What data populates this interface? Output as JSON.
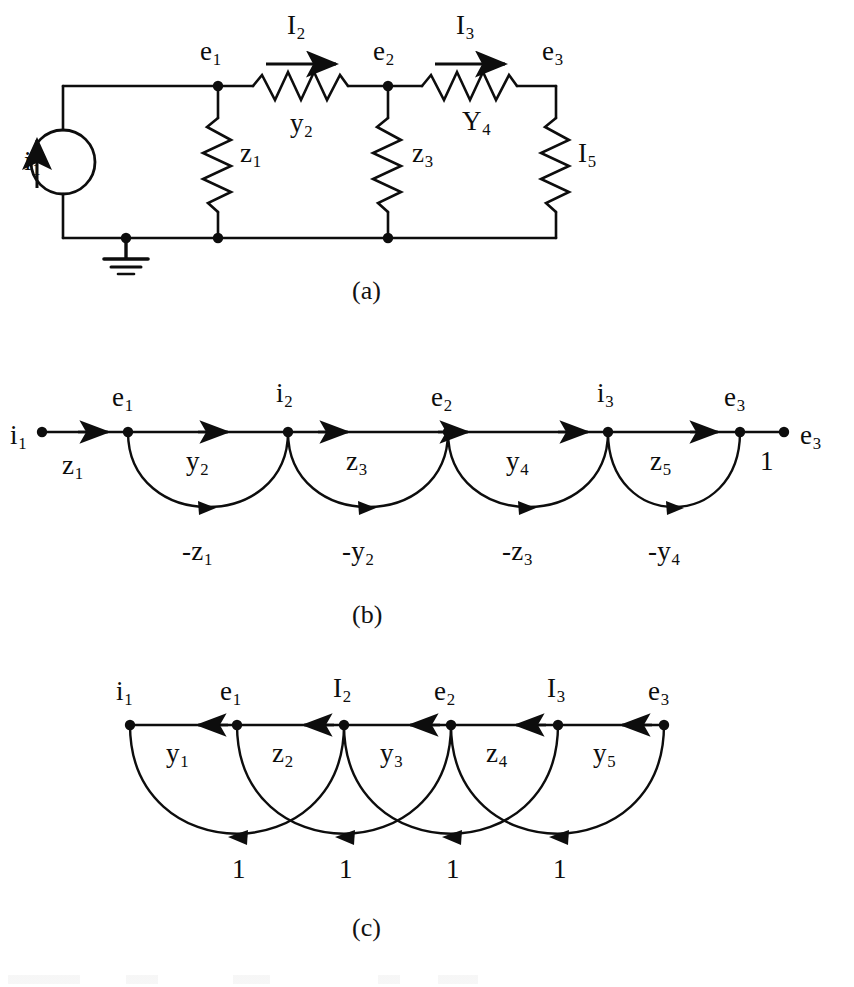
{
  "figure": {
    "captions": [
      "(a)",
      "(b)",
      "(c)"
    ]
  },
  "panel_a": {
    "caption": "(a)",
    "source_label": "i",
    "source_sub": "1",
    "source_icon": "current-source-icon",
    "ground_icon": "ground-icon",
    "node_labels": [
      {
        "base": "e",
        "sub": "1"
      },
      {
        "base": "e",
        "sub": "2"
      },
      {
        "base": "e",
        "sub": "3"
      }
    ],
    "current_labels": [
      {
        "base": "I",
        "sub": "2"
      },
      {
        "base": "I",
        "sub": "3"
      }
    ],
    "element_labels": [
      {
        "base": "z",
        "sub": "1"
      },
      {
        "base": "y",
        "sub": "2"
      },
      {
        "base": "z",
        "sub": "3"
      },
      {
        "base": "Y",
        "sub": "4"
      },
      {
        "base": "I",
        "sub": "5"
      }
    ]
  },
  "panel_b": {
    "caption": "(b)",
    "nodes": [
      {
        "base": "i",
        "sub": "1"
      },
      {
        "base": "e",
        "sub": "1"
      },
      {
        "base": "i",
        "sub": "2"
      },
      {
        "base": "e",
        "sub": "2"
      },
      {
        "base": "i",
        "sub": "3"
      },
      {
        "base": "e",
        "sub": "3"
      },
      {
        "base": "e",
        "sub": "3"
      }
    ],
    "forward_branch_labels": [
      {
        "base": "z",
        "sub": "1"
      },
      {
        "base": "y",
        "sub": "2"
      },
      {
        "base": "z",
        "sub": "3"
      },
      {
        "base": "y",
        "sub": "4"
      },
      {
        "base": "z",
        "sub": "5"
      },
      {
        "base": "1",
        "sub": ""
      }
    ],
    "feedback_branch_labels": [
      {
        "base": "-z",
        "sub": "1"
      },
      {
        "base": "-y",
        "sub": "2"
      },
      {
        "base": "-z",
        "sub": "3"
      },
      {
        "base": "-y",
        "sub": "4"
      }
    ]
  },
  "panel_c": {
    "caption": "(c)",
    "nodes": [
      {
        "base": "i",
        "sub": "1"
      },
      {
        "base": "e",
        "sub": "1"
      },
      {
        "base": "I",
        "sub": "2"
      },
      {
        "base": "e",
        "sub": "2"
      },
      {
        "base": "I",
        "sub": "3"
      },
      {
        "base": "e",
        "sub": "3"
      }
    ],
    "branch_labels": [
      {
        "base": "y",
        "sub": "1"
      },
      {
        "base": "z",
        "sub": "2"
      },
      {
        "base": "y",
        "sub": "3"
      },
      {
        "base": "z",
        "sub": "4"
      },
      {
        "base": "y",
        "sub": "5"
      }
    ],
    "feedback_branch_labels": [
      {
        "base": "1",
        "sub": ""
      },
      {
        "base": "1",
        "sub": ""
      },
      {
        "base": "1",
        "sub": ""
      },
      {
        "base": "1",
        "sub": ""
      }
    ]
  },
  "colors": {
    "ink": "#0d0d0d",
    "paper": "#ffffff"
  }
}
